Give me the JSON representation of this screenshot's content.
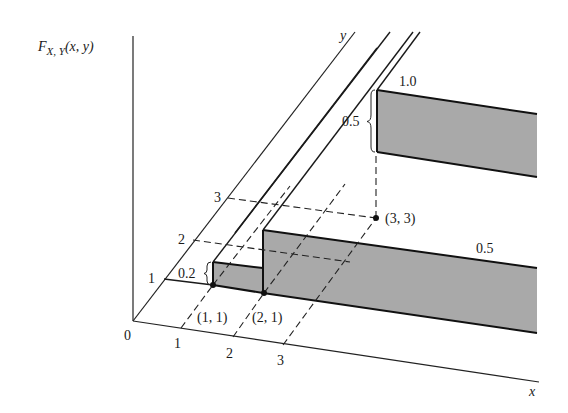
{
  "figure": {
    "function_label": "F",
    "function_subscript": "X, Y",
    "function_args": "(x, y)",
    "x_axis_label": "x",
    "y_axis_label": "y",
    "origin_label": "0",
    "x_ticks": [
      "1",
      "2",
      "3"
    ],
    "y_ticks": [
      "1",
      "2",
      "3"
    ],
    "points": [
      {
        "label": "(1, 1)",
        "x": 1,
        "y": 1
      },
      {
        "label": "(2, 1)",
        "x": 2,
        "y": 1
      },
      {
        "label": "(3, 3)",
        "x": 3,
        "y": 3
      }
    ],
    "step_labels": {
      "jump_at_1_1": "0.2",
      "level_lower_band": "0.5",
      "jump_at_3_3": "0.5",
      "level_upper_band": "1.0"
    },
    "colors": {
      "shade": "#a9a9a9",
      "line": "#1a1a1a",
      "background": "#ffffff"
    }
  }
}
